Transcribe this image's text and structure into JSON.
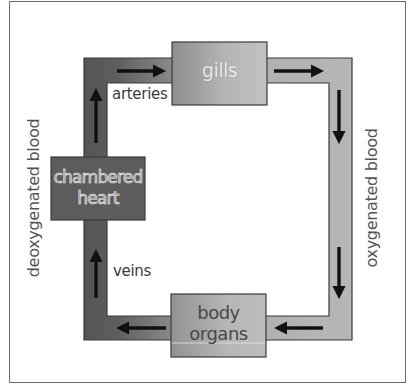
{
  "diagram": {
    "nodes": {
      "gills": {
        "label": "gills"
      },
      "heart": {
        "label_line1": "chambered",
        "label_line2": "heart"
      },
      "body": {
        "label_line1": "body",
        "label_line2": "organs"
      }
    },
    "vessel_labels": {
      "arteries": "arteries",
      "veins": "veins"
    },
    "side_labels": {
      "left": "deoxygenated blood",
      "right": "oxygenated blood"
    },
    "flow": [
      {
        "from": "chambered heart",
        "to": "gills",
        "via": "arteries"
      },
      {
        "from": "gills",
        "to": "body organs"
      },
      {
        "from": "body organs",
        "to": "chambered heart",
        "via": "veins"
      }
    ],
    "arrows": [
      {
        "position": "top-left",
        "direction": "right"
      },
      {
        "position": "top-right",
        "direction": "right"
      },
      {
        "position": "right-upper",
        "direction": "down"
      },
      {
        "position": "right-lower",
        "direction": "down"
      },
      {
        "position": "bottom-right",
        "direction": "left"
      },
      {
        "position": "bottom-left",
        "direction": "left"
      },
      {
        "position": "left-lower",
        "direction": "up"
      },
      {
        "position": "left-upper",
        "direction": "up"
      }
    ],
    "colors": {
      "deoxygenated": "#5a5a5a",
      "oxygenated": "#b4b4b4",
      "arrow": "#111111",
      "outline": "#3a3a3a"
    }
  }
}
